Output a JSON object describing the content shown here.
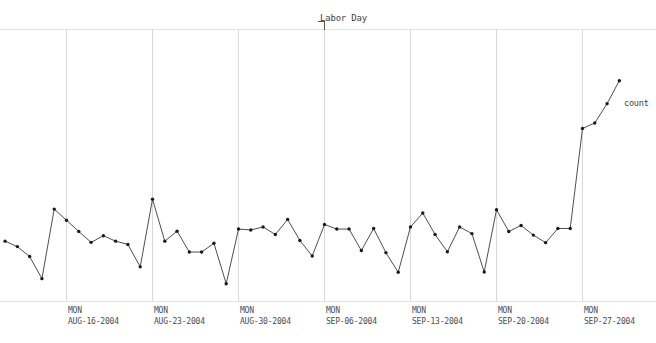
{
  "chart_data": {
    "type": "line",
    "title": "",
    "subtitle": "",
    "xlabel": "",
    "ylabel": "",
    "grid": "vertical-weekly",
    "legend_position": "series-end-right",
    "series": [
      {
        "name": "count",
        "label": "count",
        "color": "#1a1a1a",
        "marker": "dot",
        "x": [
          "AUG-11-2004",
          "AUG-12-2004",
          "AUG-13-2004",
          "AUG-14-2004",
          "AUG-15-2004",
          "AUG-16-2004",
          "AUG-17-2004",
          "AUG-18-2004",
          "AUG-19-2004",
          "AUG-20-2004",
          "AUG-21-2004",
          "AUG-22-2004",
          "AUG-23-2004",
          "AUG-24-2004",
          "AUG-25-2004",
          "AUG-26-2004",
          "AUG-27-2004",
          "AUG-28-2004",
          "AUG-29-2004",
          "AUG-30-2004",
          "AUG-31-2004",
          "SEP-01-2004",
          "SEP-02-2004",
          "SEP-03-2004",
          "SEP-04-2004",
          "SEP-05-2004",
          "SEP-06-2004",
          "SEP-07-2004",
          "SEP-08-2004",
          "SEP-09-2004",
          "SEP-10-2004",
          "SEP-11-2004",
          "SEP-12-2004",
          "SEP-13-2004",
          "SEP-14-2004",
          "SEP-15-2004",
          "SEP-16-2004",
          "SEP-17-2004",
          "SEP-18-2004",
          "SEP-19-2004",
          "SEP-20-2004",
          "SEP-21-2004",
          "SEP-22-2004",
          "SEP-23-2004",
          "SEP-24-2004",
          "SEP-25-2004",
          "SEP-26-2004",
          "SEP-27-2004",
          "SEP-28-2004",
          "SEP-29-2004",
          "SEP-30-2004"
        ],
        "values": [
          198,
          180,
          147,
          74,
          304,
          267,
          230,
          194,
          216,
          198,
          187,
          113,
          337,
          198,
          231,
          162,
          162,
          191,
          57,
          238,
          235,
          245,
          220,
          270,
          200,
          149,
          253,
          238,
          238,
          167,
          240,
          160,
          95,
          245,
          291,
          220,
          163,
          245,
          223,
          96,
          302,
          230,
          250,
          218,
          193,
          240,
          240,
          571,
          589,
          653,
          729
        ],
        "unit": "count"
      }
    ],
    "x_ticks": [
      {
        "dow": "MON",
        "date": "AUG-16-2004"
      },
      {
        "dow": "MON",
        "date": "AUG-23-2004"
      },
      {
        "dow": "MON",
        "date": "AUG-30-2004"
      },
      {
        "dow": "MON",
        "date": "SEP-06-2004"
      },
      {
        "dow": "MON",
        "date": "SEP-13-2004"
      },
      {
        "dow": "MON",
        "date": "SEP-20-2004"
      },
      {
        "dow": "MON",
        "date": "SEP-27-2004"
      }
    ],
    "annotations": [
      {
        "label": "Labor Day",
        "at_x": "SEP-06-2004",
        "style": "tick-with-label-top"
      }
    ],
    "axis": {
      "y_visible": false,
      "y_tick_labels": [],
      "x_axis_line": true,
      "top_line": true
    },
    "colors": {
      "series": "#1a1a1a",
      "gridline": "#d8d8d8",
      "axis": "#e2e2e2",
      "text": "#4c4c4c",
      "background": "#ffffff"
    }
  },
  "tick_labels": {
    "t0_dow": "MON",
    "t0_date": "AUG-16-2004",
    "t1_dow": "MON",
    "t1_date": "AUG-23-2004",
    "t2_dow": "MON",
    "t2_date": "AUG-30-2004",
    "t3_dow": "MON",
    "t3_date": "SEP-06-2004",
    "t4_dow": "MON",
    "t4_date": "SEP-13-2004",
    "t5_dow": "MON",
    "t5_date": "SEP-20-2004",
    "t6_dow": "MON",
    "t6_date": "SEP-27-2004"
  },
  "annotation": {
    "labor_day": "Labor Day"
  },
  "series_label": {
    "count": "count"
  }
}
